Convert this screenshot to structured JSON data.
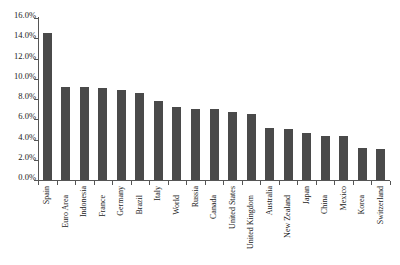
{
  "chart_data": {
    "type": "bar",
    "title": "",
    "subtitle": "",
    "xlabel": "",
    "ylabel": "",
    "ylim": [
      0,
      16
    ],
    "y_tick_labels": [
      "0.0%",
      "2.0%",
      "4.0%",
      "6.0%",
      "8.0%",
      "10.0%",
      "12.0%",
      "14.0%",
      "16.0%"
    ],
    "y_tick_values": [
      0,
      2,
      4,
      6,
      8,
      10,
      12,
      14,
      16
    ],
    "grid": false,
    "legend": null,
    "bar_color": "#4a4a4a",
    "axis_color": "#555555",
    "categories": [
      "Spain",
      "Euro Area",
      "Indonesia",
      "France",
      "Germany",
      "Brazil",
      "Italy",
      "World",
      "Russia",
      "Canada",
      "United States",
      "United Kingdom",
      "Australia",
      "New Zealand",
      "Japan",
      "China",
      "Mexico",
      "Korea",
      "Switzerland"
    ],
    "values": [
      14.5,
      9.2,
      9.2,
      9.1,
      8.9,
      8.6,
      7.8,
      7.2,
      7.0,
      7.0,
      6.7,
      6.5,
      5.1,
      5.0,
      4.6,
      4.3,
      4.3,
      3.2,
      3.1
    ]
  }
}
